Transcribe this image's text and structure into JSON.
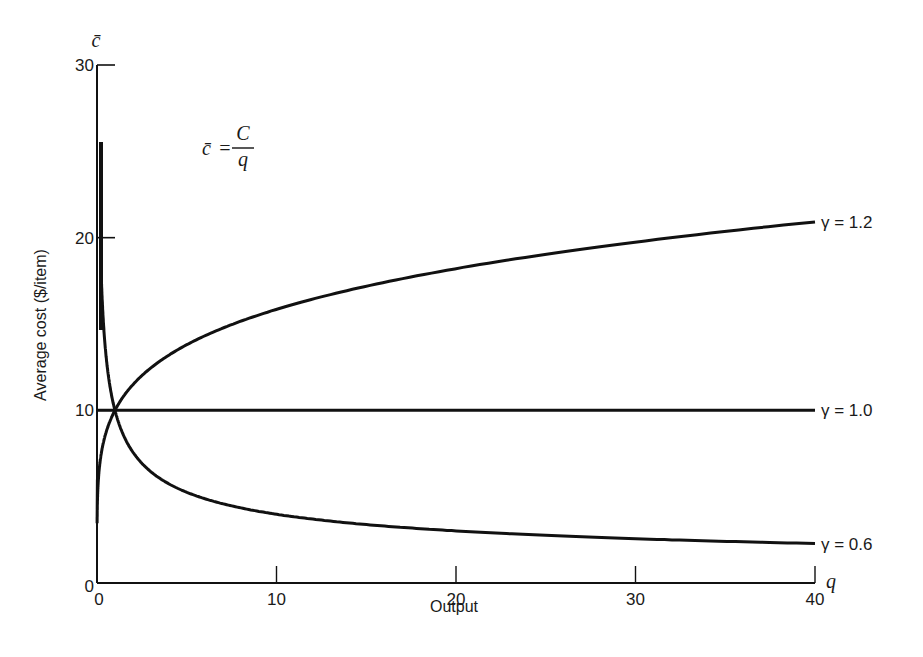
{
  "chart_data": {
    "type": "line",
    "title": "",
    "formula": {
      "lhs": "c̄",
      "eq": "=",
      "num": "C",
      "den": "q"
    },
    "xlabel": "Output",
    "x_axis_symbol": "q",
    "ylabel": "Average cost ($/item)",
    "y_axis_symbol": "c̄",
    "xlim": [
      0,
      40
    ],
    "ylim": [
      0,
      30
    ],
    "x_ticks": [
      0,
      10,
      20,
      30,
      40
    ],
    "y_ticks": [
      0,
      10,
      20,
      30
    ],
    "x_tick_labels": [
      "0",
      "10",
      "20",
      "30",
      "40"
    ],
    "y_tick_labels": [
      "0",
      "10",
      "20",
      "30"
    ],
    "grid": false,
    "legend": "inline labels at right end of curves",
    "series": [
      {
        "name": "γ = 1.2",
        "gamma": 1.2,
        "x": [
          0.1,
          0.5,
          1,
          2,
          5,
          10,
          15,
          20,
          25,
          30,
          35,
          40
        ],
        "values": [
          6.3,
          8.7,
          10.0,
          11.5,
          13.8,
          15.8,
          17.2,
          18.2,
          19.0,
          19.7,
          20.4,
          20.9
        ]
      },
      {
        "name": "γ = 1.0",
        "gamma": 1.0,
        "x": [
          0,
          10,
          20,
          30,
          40
        ],
        "values": [
          10,
          10,
          10,
          10,
          10
        ]
      },
      {
        "name": "γ = 0.6",
        "gamma": 0.6,
        "x": [
          0.2,
          0.5,
          1,
          2,
          5,
          10,
          15,
          20,
          25,
          30,
          35,
          40
        ],
        "values": [
          25.5,
          13.2,
          10.0,
          7.6,
          5.3,
          4.0,
          3.4,
          3.0,
          2.8,
          2.6,
          2.4,
          2.3
        ]
      }
    ]
  }
}
